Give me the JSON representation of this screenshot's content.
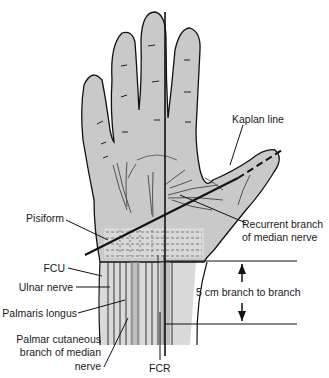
{
  "colors": {
    "skin": "#c8c8c8",
    "skin_light": "#dcdcdc",
    "outline": "#111111",
    "background": "#ffffff"
  },
  "labels": {
    "kaplan_line": "Kaplan line",
    "recurrent_branch_line1": "Recurrent branch",
    "recurrent_branch_line2": "of median nerve",
    "pisiform": "Pisiform",
    "fcu": "FCU",
    "ulnar_nerve": "Ulnar nerve",
    "palmaris_longus": "Palmaris longus",
    "palmar_cutaneous_line1": "Palmar cutaneous",
    "palmar_cutaneous_line2": "branch of median",
    "palmar_cutaneous_line3": "nerve",
    "fcr": "FCR",
    "distance": "5 cm branch to branch"
  }
}
